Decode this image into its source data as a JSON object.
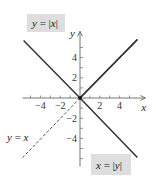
{
  "chart_data": {
    "type": "line",
    "title": "",
    "xlabel": "x",
    "ylabel": "y",
    "xlim": [
      -5.8,
      6.6
    ],
    "ylim": [
      -6.8,
      6.6
    ],
    "x_ticks": [
      -5,
      -4,
      -3,
      -2,
      -1,
      1,
      2,
      3,
      4,
      5
    ],
    "x_tick_labels": [
      {
        "value": -4,
        "text": "−4"
      },
      {
        "value": -2,
        "text": "−2"
      },
      {
        "value": 2,
        "text": "2"
      },
      {
        "value": 4,
        "text": "4"
      }
    ],
    "y_ticks": [
      -6,
      -5,
      -4,
      -3,
      -2,
      -1,
      1,
      2,
      3,
      4,
      5
    ],
    "y_tick_labels": [
      {
        "value": 4,
        "text": "4"
      },
      {
        "value": 2,
        "text": "2"
      },
      {
        "value": -2,
        "text": "−2"
      },
      {
        "value": -4,
        "text": "−4"
      }
    ],
    "grid": false,
    "series": [
      {
        "name": "y = |x|",
        "style": "solid",
        "color": "#333333",
        "points": [
          [
            -5.7,
            5.7
          ],
          [
            0,
            0
          ],
          [
            5.8,
            5.8
          ]
        ]
      },
      {
        "name": "x = |y|",
        "style": "solid",
        "color": "#333333",
        "points": [
          [
            5.8,
            5.8
          ],
          [
            0,
            0
          ],
          [
            5.8,
            -5.9
          ]
        ]
      },
      {
        "name": "y = x",
        "style": "dashed",
        "color": "#555555",
        "points": [
          [
            0,
            0
          ],
          [
            -5.8,
            -5.9
          ]
        ]
      }
    ],
    "annotations": [
      {
        "id": "label-y-abs-x",
        "parts": [
          {
            "t": "y",
            "i": true
          },
          {
            "t": " = |",
            "i": false
          },
          {
            "t": "x",
            "i": true
          },
          {
            "t": "|",
            "i": false
          }
        ],
        "boxed": true,
        "anchor": "top-left"
      },
      {
        "id": "label-x-abs-y",
        "parts": [
          {
            "t": "x",
            "i": true
          },
          {
            "t": " = |",
            "i": false
          },
          {
            "t": "y",
            "i": true
          },
          {
            "t": "|",
            "i": false
          }
        ],
        "boxed": true,
        "anchor": "bottom-right"
      },
      {
        "id": "label-y-eq-x",
        "parts": [
          {
            "t": "y",
            "i": true
          },
          {
            "t": " = ",
            "i": false
          },
          {
            "t": "x",
            "i": true
          }
        ],
        "boxed": false,
        "anchor": "lower-left"
      }
    ],
    "origin_marker": true
  }
}
